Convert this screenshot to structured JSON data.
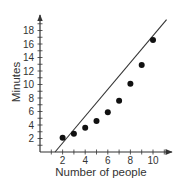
{
  "chart_data": {
    "type": "scatter",
    "title": "",
    "xlabel": "Number of people",
    "ylabel": "Minutes",
    "xlim": [
      0,
      11.5
    ],
    "ylim": [
      0,
      20
    ],
    "grid": false,
    "legend": null,
    "x_ticks": [
      2,
      4,
      6,
      8,
      10
    ],
    "y_ticks": [
      2,
      4,
      6,
      8,
      10,
      12,
      14,
      16,
      18
    ],
    "series": [
      {
        "name": "Data",
        "x": [
          2,
          3,
          4,
          5,
          6,
          7,
          8,
          9,
          10
        ],
        "y": [
          2.1,
          2.7,
          3.6,
          4.6,
          5.9,
          7.6,
          10.1,
          12.9,
          16.6
        ]
      }
    ],
    "fit_line": {
      "name": "Line of fit",
      "x": [
        1.33,
        11.2
      ],
      "y": [
        0,
        19.6
      ]
    }
  },
  "colors": {
    "axis": "#333333",
    "points": "#111111",
    "line": "#333333"
  }
}
